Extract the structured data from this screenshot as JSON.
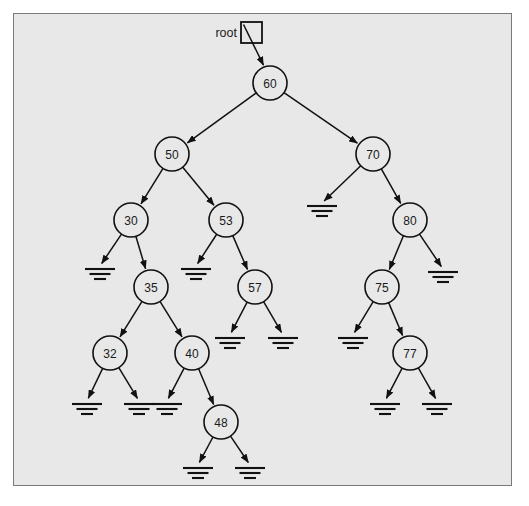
{
  "figure": {
    "kind": "binary-search-tree-diagram",
    "root_label": "root",
    "null_symbol_name": "ground-symbol",
    "colors": {
      "page_background": "#ffffff",
      "panel_background": "#e8e8e8",
      "panel_border": "#7a7a7a",
      "node_fill": "#e8e8e8",
      "stroke": "#111111",
      "text": "#1a1a1a"
    }
  },
  "tree": {
    "root_value": "60",
    "node_count": 13,
    "null_count": 14,
    "values": [
      "60",
      "50",
      "70",
      "30",
      "53",
      "80",
      "35",
      "57",
      "75",
      "32",
      "40",
      "77",
      "48"
    ],
    "nodes": [
      {
        "id": "n60",
        "label": "60",
        "x": 270,
        "y": 83,
        "r": 17,
        "left": "n50",
        "right": "n70"
      },
      {
        "id": "n50",
        "label": "50",
        "x": 172,
        "y": 154,
        "r": 17,
        "left": "n30",
        "right": "n53"
      },
      {
        "id": "n70",
        "label": "70",
        "x": 373,
        "y": 154,
        "r": 17,
        "left": null,
        "right": "n80"
      },
      {
        "id": "n30",
        "label": "30",
        "x": 131,
        "y": 220,
        "r": 17,
        "left": null,
        "right": "n35"
      },
      {
        "id": "n53",
        "label": "53",
        "x": 226,
        "y": 220,
        "r": 17,
        "left": null,
        "right": "n57"
      },
      {
        "id": "n80",
        "label": "80",
        "x": 410,
        "y": 220,
        "r": 17,
        "left": "n75",
        "right": null
      },
      {
        "id": "n35",
        "label": "35",
        "x": 151,
        "y": 287,
        "r": 17,
        "left": "n32",
        "right": "n40"
      },
      {
        "id": "n57",
        "label": "57",
        "x": 255,
        "y": 287,
        "r": 17,
        "left": null,
        "right": null
      },
      {
        "id": "n75",
        "label": "75",
        "x": 382,
        "y": 287,
        "r": 17,
        "left": null,
        "right": "n77"
      },
      {
        "id": "n32",
        "label": "32",
        "x": 110,
        "y": 353,
        "r": 17,
        "left": null,
        "right": null
      },
      {
        "id": "n40",
        "label": "40",
        "x": 192,
        "y": 353,
        "r": 17,
        "left": null,
        "right": "n48"
      },
      {
        "id": "n77",
        "label": "77",
        "x": 410,
        "y": 353,
        "r": 17,
        "left": null,
        "right": null
      },
      {
        "id": "n48",
        "label": "48",
        "x": 221,
        "y": 422,
        "r": 17,
        "left": null,
        "right": null
      }
    ],
    "nulls": [
      {
        "id": "g1",
        "parent": "n70",
        "side": "left",
        "x": 322,
        "y": 212
      },
      {
        "id": "g2",
        "parent": "n30",
        "side": "left",
        "x": 100,
        "y": 275
      },
      {
        "id": "g3",
        "parent": "n53",
        "side": "left",
        "x": 196,
        "y": 275
      },
      {
        "id": "g4",
        "parent": "n80",
        "side": "right",
        "x": 443,
        "y": 278
      },
      {
        "id": "g5",
        "parent": "n57",
        "side": "left",
        "x": 230,
        "y": 344
      },
      {
        "id": "g6",
        "parent": "n57",
        "side": "right",
        "x": 283,
        "y": 344
      },
      {
        "id": "g7",
        "parent": "n75",
        "side": "left",
        "x": 353,
        "y": 344
      },
      {
        "id": "g8",
        "parent": "n32",
        "side": "left",
        "x": 87,
        "y": 410
      },
      {
        "id": "g9",
        "parent": "n32",
        "side": "right",
        "x": 139,
        "y": 410
      },
      {
        "id": "g10",
        "parent": "n40",
        "side": "left",
        "x": 167,
        "y": 410
      },
      {
        "id": "g11",
        "parent": "n77",
        "side": "left",
        "x": 385,
        "y": 410
      },
      {
        "id": "g12",
        "parent": "n77",
        "side": "right",
        "x": 437,
        "y": 410
      },
      {
        "id": "g13",
        "parent": "n48",
        "side": "left",
        "x": 198,
        "y": 474
      },
      {
        "id": "g14",
        "parent": "n48",
        "side": "right",
        "x": 250,
        "y": 474
      }
    ],
    "root_pointer": {
      "label": "root",
      "label_x": 237,
      "label_y": 33,
      "box_x": 241,
      "box_y": 22,
      "box_size": 21,
      "target": "n60"
    }
  }
}
